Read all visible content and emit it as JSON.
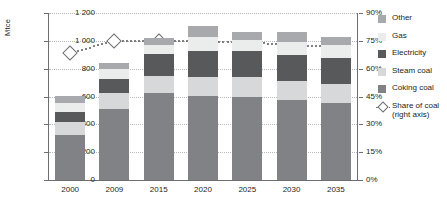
{
  "chart_data": {
    "type": "bar",
    "title": "",
    "subtitle": "",
    "ylabel": "Mtce",
    "xlabel": "",
    "categories": [
      "2000",
      "2009",
      "2015",
      "2020",
      "2025",
      "2030",
      "2035"
    ],
    "ylim": [
      0,
      1200
    ],
    "yticks": [
      "0",
      "200",
      "400",
      "600",
      "800",
      "1 000",
      "1 200"
    ],
    "y2label": "",
    "y2lim": [
      0,
      90
    ],
    "y2ticks": [
      "0%",
      "15%",
      "30%",
      "45%",
      "60%",
      "75%",
      "90%"
    ],
    "grid": true,
    "legend_position": "right",
    "stacked": true,
    "series": [
      {
        "name": "Coking coal",
        "color": "#808285",
        "values": [
          320,
          512,
          628,
          605,
          600,
          575,
          553
        ]
      },
      {
        "name": "Steam coal",
        "color": "#d7d8da",
        "values": [
          100,
          110,
          120,
          135,
          140,
          140,
          140
        ]
      },
      {
        "name": "Electricity",
        "color": "#58595b",
        "values": [
          68,
          105,
          155,
          185,
          185,
          185,
          182
        ]
      },
      {
        "name": "Gas",
        "color": "#ebecec",
        "values": [
          62,
          70,
          70,
          100,
          78,
          90,
          92
        ]
      },
      {
        "name": "Other",
        "color": "#a7a9ac",
        "values": [
          55,
          43,
          50,
          83,
          60,
          73,
          60
        ]
      }
    ],
    "line_series": {
      "name": "Share of coal",
      "legend_label": "Share of coal",
      "legend_sublabel": "(right axis)",
      "axis": "right",
      "color": "#6d6e71",
      "marker": "diamond",
      "style": "dotted",
      "values": [
        68.5,
        75.0,
        75.0,
        74.5,
        74.0,
        73.0,
        71.5
      ]
    }
  }
}
